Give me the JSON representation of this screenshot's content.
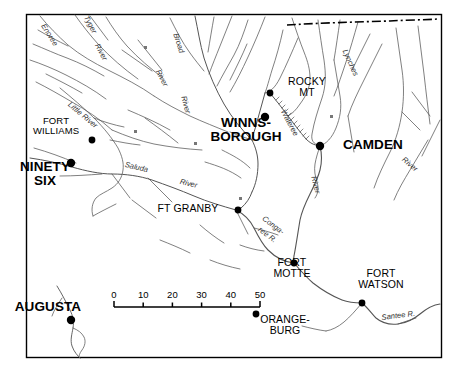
{
  "map": {
    "title": "Upper South Carolina Revolutionary War Map",
    "frame_color": "#000000",
    "background_color": "#ffffff",
    "river_color": "#555555",
    "places": [
      {
        "name": "ninety-six",
        "label": "NINETY\nSIX",
        "size": "major",
        "x": 45,
        "y": 174,
        "dot_x": 71,
        "dot_y": 163
      },
      {
        "name": "fort-williams",
        "label": "FORT\nWILLIAMS",
        "size": "minor",
        "x": 56,
        "y": 126,
        "dot_x": 92,
        "dot_y": 140
      },
      {
        "name": "winnsborough",
        "label": "WINNS-\nBOROUGH",
        "size": "major",
        "x": 246,
        "y": 130,
        "dot_x": 265,
        "dot_y": 117
      },
      {
        "name": "rocky-mt",
        "label": "ROCKY\nMT",
        "size": "medium",
        "x": 307,
        "y": 87,
        "dot_x": 270,
        "dot_y": 93
      },
      {
        "name": "camden",
        "label": "CAMDEN",
        "size": "major",
        "x": 373,
        "y": 145,
        "dot_x": 320,
        "dot_y": 146
      },
      {
        "name": "ft-granby",
        "label": "FT GRANBY",
        "size": "medium",
        "x": 188,
        "y": 208,
        "dot_x": 238,
        "dot_y": 210
      },
      {
        "name": "fort-motte",
        "label": "FORT\nMOTTE",
        "size": "medium",
        "x": 292,
        "y": 268,
        "dot_x": 294,
        "dot_y": 263
      },
      {
        "name": "fort-watson",
        "label": "FORT\nWATSON",
        "size": "medium",
        "x": 381,
        "y": 279,
        "dot_x": 362,
        "dot_y": 303
      },
      {
        "name": "orangeburg",
        "label": "ORANGE-\nBURG",
        "size": "medium",
        "x": 285,
        "y": 325,
        "dot_x": 256,
        "dot_y": 314
      },
      {
        "name": "augusta",
        "label": "AUGUSTA",
        "size": "major",
        "x": 48,
        "y": 307,
        "dot_x": 71,
        "dot_y": 320
      }
    ],
    "rivers": [
      {
        "name": "enoree",
        "label": "Enoree",
        "x": 47,
        "y": 22,
        "rotate": 58
      },
      {
        "name": "tyger",
        "label": "Tyger",
        "x": 90,
        "y": 14,
        "rotate": 62
      },
      {
        "name": "river-tyger",
        "label": "River",
        "x": 101,
        "y": 42,
        "rotate": 62
      },
      {
        "name": "broad",
        "label": "Broad",
        "x": 180,
        "y": 32,
        "rotate": 72
      },
      {
        "name": "river-broad1",
        "label": "River",
        "x": 162,
        "y": 68,
        "rotate": 63
      },
      {
        "name": "river-broad2",
        "label": "River",
        "x": 188,
        "y": 95,
        "rotate": 75
      },
      {
        "name": "little-river",
        "label": "Little River",
        "x": 72,
        "y": 100,
        "rotate": 40
      },
      {
        "name": "saluda",
        "label": "Saluda",
        "x": 126,
        "y": 160,
        "rotate": 13
      },
      {
        "name": "river-saluda",
        "label": "River",
        "x": 181,
        "y": 177,
        "rotate": 13
      },
      {
        "name": "wateree",
        "label": "Wateree",
        "x": 287,
        "y": 108,
        "rotate": 62
      },
      {
        "name": "lynches",
        "label": "Lynches",
        "x": 349,
        "y": 48,
        "rotate": 66
      },
      {
        "name": "river-camden",
        "label": "River",
        "x": 318,
        "y": 175,
        "rotate": 76
      },
      {
        "name": "river-east",
        "label": "River",
        "x": 406,
        "y": 155,
        "rotate": 40
      },
      {
        "name": "congaree",
        "label": "Conga-",
        "x": 266,
        "y": 214,
        "rotate": 37
      },
      {
        "name": "congaree2",
        "label": "ree R.",
        "x": 262,
        "y": 225,
        "rotate": 37
      },
      {
        "name": "santee",
        "label": "Santee R.",
        "x": 381,
        "y": 313,
        "rotate": -7
      }
    ],
    "scale": {
      "name": "distance-scale-bar",
      "unit_ticks": [
        "0",
        "10",
        "20",
        "30",
        "40",
        "50"
      ],
      "x_start": 114,
      "x_end": 260,
      "y_axis": 307,
      "label_y": 289
    }
  }
}
